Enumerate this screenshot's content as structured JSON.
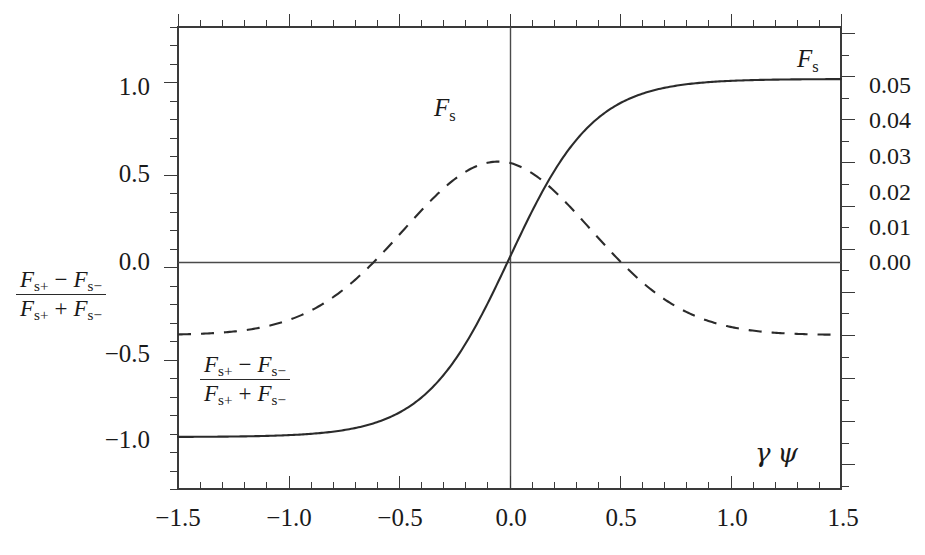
{
  "figure": {
    "background": "#ffffff",
    "axis_color": "#3a3a3a",
    "curve_color": "#2b2b2b"
  },
  "axes": {
    "left": {
      "label_num": "F",
      "label_num_sub_a": "s+",
      "label_num_minus": "−",
      "label_num_b": "F",
      "label_num_sub_b": "s−",
      "label_den_a": "F",
      "label_den_sub_a": "s+",
      "label_den_plus": "+",
      "label_den_b": "F",
      "label_den_sub_b": "s−",
      "ticks": [
        "1.0",
        "0.5",
        "0.0",
        "−0.5",
        "−1.0"
      ],
      "tick_values": [
        1.0,
        0.5,
        0.0,
        -0.5,
        -1.0
      ],
      "range": [
        -1.25,
        1.25
      ],
      "minor_tick_step": 0.1
    },
    "right": {
      "ticks": [
        "0.05",
        "0.04",
        "0.03",
        "0.02",
        "0.01",
        "0.00"
      ],
      "tick_values": [
        0.05,
        0.04,
        0.03,
        0.02,
        0.01,
        0.0
      ],
      "range": [
        -0.0357,
        0.0714
      ],
      "minor_tick_step": 0.005
    },
    "bottom": {
      "label_gamma": "γ",
      "label_psi": "ψ",
      "ticks": [
        "−1.5",
        "−1.0",
        "−0.5",
        "0.0",
        "0.5",
        "1.0",
        "1.5"
      ],
      "tick_values": [
        -1.5,
        -1.0,
        -0.5,
        0.0,
        0.5,
        1.0,
        1.5
      ],
      "range": [
        -1.5,
        1.5
      ],
      "minor_tick_step": 0.1
    }
  },
  "annotations": {
    "fs_upper_right": {
      "sym": "F",
      "sub": "s"
    },
    "fs_on_dashed": {
      "sym": "F",
      "sub": "s"
    },
    "ratio_in_plot": {
      "num_a": "F",
      "num_sub_a": "s+",
      "num_op": "−",
      "num_b": "F",
      "num_sub_b": "s−",
      "den_a": "F",
      "den_sub_a": "s+",
      "den_op": "+",
      "den_b": "F",
      "den_sub_b": "s−"
    }
  },
  "chart_data": {
    "type": "line",
    "title": "",
    "xlabel": "γ ψ",
    "ylabel_left": "(F_s+ − F_s−)/(F_s+ + F_s−)",
    "ylabel_right": "F_s",
    "grid": false,
    "legend": "inline annotations",
    "xlim": [
      -1.5,
      1.5
    ],
    "ylim_left": [
      -1.25,
      1.25
    ],
    "ylim_right": [
      -0.0357,
      0.0714
    ],
    "zero_lines": {
      "vertical_x": 0.0,
      "horizontal_y": 0.0
    },
    "x": [
      -1.5,
      -1.4,
      -1.3,
      -1.2,
      -1.1,
      -1.0,
      -0.9,
      -0.8,
      -0.7,
      -0.6,
      -0.5,
      -0.4,
      -0.3,
      -0.2,
      -0.1,
      0.0,
      0.1,
      0.2,
      0.3,
      0.4,
      0.5,
      0.6,
      0.7,
      0.8,
      0.9,
      1.0,
      1.1,
      1.2,
      1.3,
      1.4,
      1.5
    ],
    "series": [
      {
        "name": "(F_s+ − F_s−)/(F_s+ + F_s−)",
        "style": "solid",
        "axis": "left",
        "values": [
          -0.965,
          -0.962,
          -0.958,
          -0.952,
          -0.944,
          -0.933,
          -0.918,
          -0.896,
          -0.866,
          -0.824,
          -0.765,
          -0.685,
          -0.578,
          -0.443,
          -0.25,
          0.0,
          0.25,
          0.443,
          0.578,
          0.685,
          0.66,
          0.79,
          0.834,
          0.872,
          0.903,
          0.928,
          0.945,
          0.956,
          0.962,
          0.966,
          0.968
        ]
      },
      {
        "name": "F_s",
        "style": "dashed",
        "axis": "right",
        "values": [
          0.0008,
          0.0014,
          0.0024,
          0.0038,
          0.0058,
          0.0085,
          0.0119,
          0.016,
          0.0206,
          0.0255,
          0.0303,
          0.0345,
          0.0378,
          0.0397,
          0.0402,
          0.0398,
          0.0385,
          0.0363,
          0.0332,
          0.0294,
          0.0252,
          0.0209,
          0.0167,
          0.0129,
          0.0096,
          0.0068,
          0.0047,
          0.0031,
          0.002,
          0.0012,
          0.0007
        ]
      }
    ],
    "notes": [
      "Solid sigmoid (tanh-like) rises from −0.97 at γψ=−1.5 to +0.97 at γψ=+1.5, crossing zero at γψ=0.",
      "Dashed bell-shaped F_s peaks at about 0.040 (right axis) near γψ ≈ −0.05 and decays to ~0 at both ends.",
      "The two curves intersect near γψ ≈ 0.50 (left-axis value ≈ 0.66)."
    ]
  }
}
